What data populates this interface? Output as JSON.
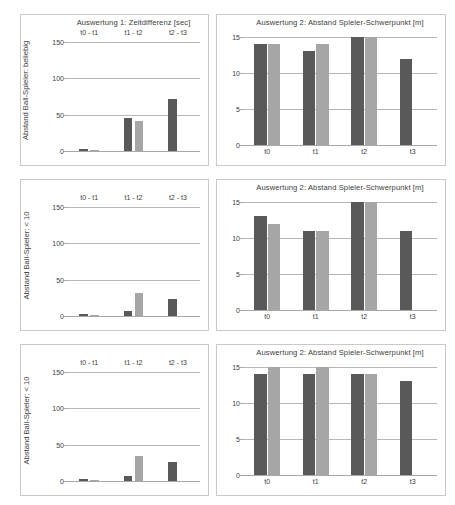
{
  "panels": [
    {
      "id": "top-left",
      "title": "Auswertung 1: Zeitdifferenz [sec]",
      "ylabel": "Abstand Ball-Spieler: beliebig",
      "xtick_position": "top",
      "chart_data": {
        "type": "bar",
        "title": "Auswertung 1: Zeitdifferenz [sec]",
        "xlabel": "",
        "ylabel": "Abstand Ball-Spieler: beliebig",
        "categories": [
          "t0 - t1",
          "t1 - t2",
          "t2 - t3"
        ],
        "series": [
          {
            "name": "dunkelgrau",
            "color": "#595959",
            "values": [
              3,
              45,
              71
            ]
          },
          {
            "name": "hellgrau",
            "color": "#a6a6a6",
            "values": [
              2,
              41,
              null
            ]
          }
        ],
        "ylim": [
          0,
          150
        ],
        "yticks": [
          0,
          50,
          100,
          150
        ],
        "grid": true,
        "legend": "none"
      }
    },
    {
      "id": "top-right",
      "title": "Auswertung 2: Abstand Spieler-Schwerpunkt [m]",
      "ylabel": "",
      "xtick_position": "bottom",
      "chart_data": {
        "type": "bar",
        "title": "Auswertung 2: Abstand Spieler-Schwerpunkt [m]",
        "xlabel": "",
        "ylabel": "",
        "categories": [
          "t0",
          "t1",
          "t2",
          "t3"
        ],
        "series": [
          {
            "name": "dunkelgrau",
            "color": "#595959",
            "values": [
              14,
              13,
              15,
              12
            ]
          },
          {
            "name": "hellgrau",
            "color": "#a6a6a6",
            "values": [
              14,
              14,
              15,
              null
            ]
          }
        ],
        "ylim": [
          0,
          15
        ],
        "yticks": [
          0,
          5,
          10,
          15
        ],
        "grid": true,
        "legend": "none"
      }
    },
    {
      "id": "middle-left",
      "title": "",
      "ylabel": "Abstand Ball-Spieler: < 10",
      "xtick_position": "top",
      "chart_data": {
        "type": "bar",
        "title": "",
        "xlabel": "",
        "ylabel": "Abstand Ball-Spieler: < 10",
        "categories": [
          "t0 - t1",
          "t1 - t2",
          "t2 - t3"
        ],
        "series": [
          {
            "name": "dunkelgrau",
            "color": "#595959",
            "values": [
              3,
              7,
              23
            ]
          },
          {
            "name": "hellgrau",
            "color": "#a6a6a6",
            "values": [
              2,
              32,
              null
            ]
          }
        ],
        "ylim": [
          0,
          150
        ],
        "yticks": [
          0,
          50,
          100,
          150
        ],
        "grid": true,
        "legend": "none"
      }
    },
    {
      "id": "middle-right",
      "title": "Auswertung 2: Abstand Spieler-Schwerpunkt [m]",
      "ylabel": "",
      "xtick_position": "bottom",
      "chart_data": {
        "type": "bar",
        "title": "Auswertung 2: Abstand Spieler-Schwerpunkt [m]",
        "xlabel": "",
        "ylabel": "",
        "categories": [
          "t0",
          "t1",
          "t2",
          "t3"
        ],
        "series": [
          {
            "name": "dunkelgrau",
            "color": "#595959",
            "values": [
              13,
              11,
              15,
              11
            ]
          },
          {
            "name": "hellgrau",
            "color": "#a6a6a6",
            "values": [
              12,
              11,
              15,
              null
            ]
          }
        ],
        "ylim": [
          0,
          15
        ],
        "yticks": [
          0,
          5,
          10,
          15
        ],
        "grid": true,
        "legend": "none"
      }
    },
    {
      "id": "bottom-left",
      "title": "",
      "ylabel": "Abstand Ball-Spieler: < 10",
      "xtick_position": "top",
      "chart_data": {
        "type": "bar",
        "title": "",
        "xlabel": "",
        "ylabel": "Abstand Ball-Spieler: < 10",
        "categories": [
          "t0 - t1",
          "t1 - t2",
          "t2 - t3"
        ],
        "series": [
          {
            "name": "dunkelgrau",
            "color": "#595959",
            "values": [
              3,
              7,
              26
            ]
          },
          {
            "name": "hellgrau",
            "color": "#a6a6a6",
            "values": [
              2,
              34,
              null
            ]
          }
        ],
        "ylim": [
          0,
          150
        ],
        "yticks": [
          0,
          50,
          100,
          150
        ],
        "grid": true,
        "legend": "none"
      }
    },
    {
      "id": "bottom-right",
      "title": "Auswertung 2: Abstand Spieler-Schwerpunkt [m]",
      "ylabel": "",
      "xtick_position": "bottom",
      "chart_data": {
        "type": "bar",
        "title": "Auswertung 2: Abstand Spieler-Schwerpunkt [m]",
        "xlabel": "",
        "ylabel": "",
        "categories": [
          "t0",
          "t1",
          "t2",
          "t3"
        ],
        "series": [
          {
            "name": "dunkelgrau",
            "color": "#595959",
            "values": [
              14,
              14,
              14,
              13
            ]
          },
          {
            "name": "hellgrau",
            "color": "#a6a6a6",
            "values": [
              15,
              15,
              14,
              null
            ]
          }
        ],
        "ylim": [
          0,
          15
        ],
        "yticks": [
          0,
          5,
          10,
          15
        ],
        "grid": true,
        "legend": "none"
      }
    }
  ],
  "colors": {
    "dark_bar": "#595959",
    "light_bar": "#a6a6a6",
    "gridline": "#b7b7b7",
    "panel_border": "#c9c9c9",
    "text": "#3d3d3d",
    "background": "#ffffff"
  }
}
